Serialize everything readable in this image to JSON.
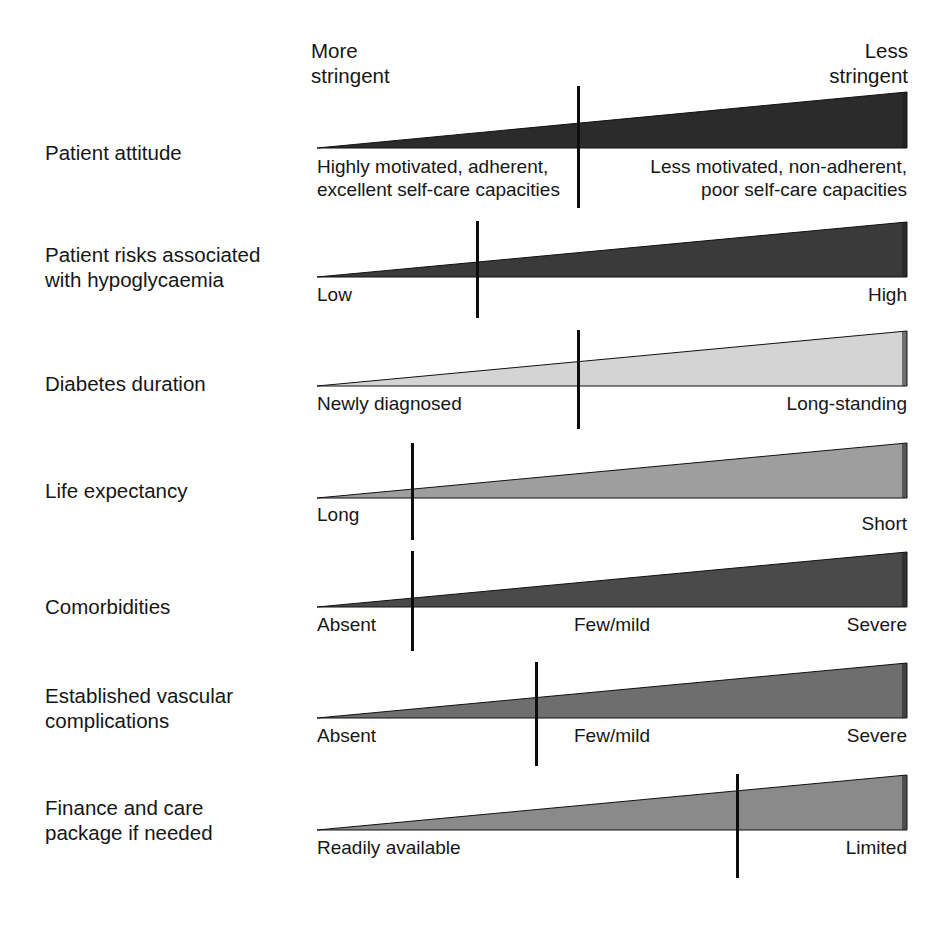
{
  "figure": {
    "axis_left_label": "More\nstringent",
    "axis_right_label": "Less\nstringent"
  },
  "chart_data": {
    "type": "bar",
    "xlabel": "",
    "ylabel": "",
    "legend_position": "top",
    "axis_labels": {
      "left": "More stringent",
      "right": "Less stringent"
    },
    "categories": [
      "Patient attitude",
      "Patient risks associated with hypoglycaemia",
      "Diabetes duration",
      "Life expectancy",
      "Comorbidities",
      "Established vascular complications",
      "Finance and care package if needed"
    ],
    "series": [
      {
        "name": "Marker position (% along More→Less stringent axis)",
        "values": [
          44,
          27,
          44,
          16,
          16,
          37,
          71
        ]
      }
    ]
  },
  "rows": [
    {
      "id": "patient-attitude",
      "label": "Patient attitude",
      "fill": "#2b2b2b",
      "marker_pct": 44,
      "top": 92,
      "label_top": 140,
      "wedge_top": 92,
      "wedge_height": 56,
      "marker_top": 86,
      "marker_height": 122,
      "scale_labels": [
        {
          "text": "Highly motivated, adherent,\nexcellent self-care capacities",
          "align": "start",
          "pos_pct": 0,
          "top": 155
        },
        {
          "text": "Less motivated, non-adherent,\npoor self-care capacities",
          "align": "end",
          "pos_pct": 100,
          "top": 155
        }
      ]
    },
    {
      "id": "hypoglycaemia-risk",
      "label": "Patient risks associated\nwith hypoglycaemia",
      "fill": "#3a3a3a",
      "marker_pct": 27,
      "top": 222,
      "label_top": 242,
      "wedge_top": 222,
      "wedge_height": 55,
      "marker_top": 221,
      "marker_height": 97,
      "scale_labels": [
        {
          "text": "Low",
          "align": "start",
          "pos_pct": 0,
          "top": 283
        },
        {
          "text": "High",
          "align": "end",
          "pos_pct": 100,
          "top": 283
        }
      ]
    },
    {
      "id": "diabetes-duration",
      "label": "Diabetes duration",
      "fill": "#d4d4d4",
      "marker_pct": 44,
      "top": 331,
      "label_top": 371,
      "wedge_top": 331,
      "wedge_height": 55,
      "marker_top": 330,
      "marker_height": 99,
      "scale_labels": [
        {
          "text": "Newly diagnosed",
          "align": "start",
          "pos_pct": 0,
          "top": 392
        },
        {
          "text": "Long-standing",
          "align": "end",
          "pos_pct": 100,
          "top": 392
        }
      ]
    },
    {
      "id": "life-expectancy",
      "label": "Life expectancy",
      "fill": "#9e9e9e",
      "marker_pct": 16,
      "top": 443,
      "label_top": 478,
      "wedge_top": 443,
      "wedge_height": 55,
      "marker_top": 443,
      "marker_height": 97,
      "scale_labels": [
        {
          "text": "Long",
          "align": "start",
          "pos_pct": 0,
          "top": 503
        },
        {
          "text": "Short",
          "align": "end",
          "pos_pct": 100,
          "top": 512
        }
      ]
    },
    {
      "id": "comorbidities",
      "label": "Comorbidities",
      "fill": "#4a4a4a",
      "marker_pct": 16,
      "top": 552,
      "label_top": 594,
      "wedge_top": 552,
      "wedge_height": 55,
      "marker_top": 551,
      "marker_height": 100,
      "scale_labels": [
        {
          "text": "Absent",
          "align": "start",
          "pos_pct": 0,
          "top": 613
        },
        {
          "text": "Few/mild",
          "align": "mid",
          "pos_pct": 50,
          "top": 613
        },
        {
          "text": "Severe",
          "align": "end",
          "pos_pct": 100,
          "top": 613
        }
      ]
    },
    {
      "id": "vascular-complications",
      "label": "Established vascular\ncomplications",
      "fill": "#6e6e6e",
      "marker_pct": 37,
      "top": 663,
      "label_top": 683,
      "wedge_top": 663,
      "wedge_height": 55,
      "marker_top": 662,
      "marker_height": 104,
      "scale_labels": [
        {
          "text": "Absent",
          "align": "start",
          "pos_pct": 0,
          "top": 724
        },
        {
          "text": "Few/mild",
          "align": "mid",
          "pos_pct": 50,
          "top": 724
        },
        {
          "text": "Severe",
          "align": "end",
          "pos_pct": 100,
          "top": 724
        }
      ]
    },
    {
      "id": "finance-care-package",
      "label": "Finance and care\npackage if needed",
      "fill": "#8a8a8a",
      "marker_pct": 71,
      "top": 775,
      "label_top": 795,
      "wedge_top": 775,
      "wedge_height": 55,
      "marker_top": 774,
      "marker_height": 104,
      "scale_labels": [
        {
          "text": "Readily available",
          "align": "start",
          "pos_pct": 0,
          "top": 836
        },
        {
          "text": "Limited",
          "align": "end",
          "pos_pct": 100,
          "top": 836
        }
      ]
    }
  ]
}
